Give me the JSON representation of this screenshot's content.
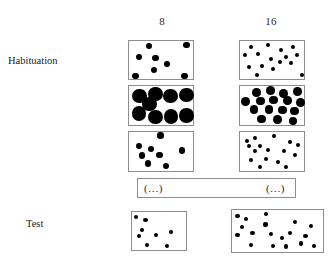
{
  "figure": {
    "columns": [
      {
        "id": "col-8",
        "label": "8"
      },
      {
        "id": "col-16",
        "label": "16"
      }
    ],
    "rows": [
      {
        "id": "row-habituation",
        "label": "Habituation"
      },
      {
        "id": "row-test",
        "label": "Test"
      }
    ],
    "continuation": {
      "left_label": "(…)",
      "right_label": "(…)"
    },
    "colors": {
      "dot": "#000000",
      "box_border": "#8e8e8e",
      "background": "#ffffff",
      "text": "#1a1a1a"
    }
  },
  "chart_data": {
    "type": "scatter",
    "xlabel": "",
    "ylabel": "",
    "grid": false,
    "legend": "none",
    "columns": [
      "8",
      "16"
    ],
    "rows": [
      "Habituation",
      "Test"
    ],
    "panels": [
      {
        "id": "hab-8-a",
        "row": "Habituation",
        "column": "8",
        "numerosity": 8,
        "dot_size": "medium",
        "box": {
          "x": 128,
          "y": 40,
          "w": 66,
          "h": 40
        },
        "dot_radius": 3.2,
        "dots": [
          {
            "x": 0.3,
            "y": 0.13
          },
          {
            "x": 0.87,
            "y": 0.1
          },
          {
            "x": 0.15,
            "y": 0.4
          },
          {
            "x": 0.4,
            "y": 0.43
          },
          {
            "x": 0.58,
            "y": 0.57
          },
          {
            "x": 0.38,
            "y": 0.73
          },
          {
            "x": 0.1,
            "y": 0.87
          },
          {
            "x": 0.84,
            "y": 0.88
          }
        ]
      },
      {
        "id": "hab-16-a",
        "row": "Habituation",
        "column": "16",
        "numerosity": 16,
        "dot_size": "small",
        "box": {
          "x": 239,
          "y": 40,
          "w": 66,
          "h": 40
        },
        "dot_radius": 2.0,
        "dots": [
          {
            "x": 0.16,
            "y": 0.15
          },
          {
            "x": 0.42,
            "y": 0.1
          },
          {
            "x": 0.62,
            "y": 0.22
          },
          {
            "x": 0.8,
            "y": 0.14
          },
          {
            "x": 0.08,
            "y": 0.36
          },
          {
            "x": 0.27,
            "y": 0.33
          },
          {
            "x": 0.47,
            "y": 0.44
          },
          {
            "x": 0.7,
            "y": 0.41
          },
          {
            "x": 0.86,
            "y": 0.36
          },
          {
            "x": 0.6,
            "y": 0.52
          },
          {
            "x": 0.78,
            "y": 0.56
          },
          {
            "x": 0.14,
            "y": 0.64
          },
          {
            "x": 0.33,
            "y": 0.62
          },
          {
            "x": 0.5,
            "y": 0.7
          },
          {
            "x": 0.26,
            "y": 0.86
          },
          {
            "x": 0.94,
            "y": 0.84
          }
        ]
      },
      {
        "id": "hab-8-b",
        "row": "Habituation",
        "column": "8",
        "numerosity": 8,
        "dot_size": "large",
        "box": {
          "x": 128,
          "y": 85,
          "w": 66,
          "h": 41
        },
        "dot_radius": 7.2,
        "dots": [
          {
            "x": 0.16,
            "y": 0.24
          },
          {
            "x": 0.4,
            "y": 0.2
          },
          {
            "x": 0.63,
            "y": 0.25
          },
          {
            "x": 0.87,
            "y": 0.22
          },
          {
            "x": 0.31,
            "y": 0.44
          },
          {
            "x": 0.15,
            "y": 0.67
          },
          {
            "x": 0.4,
            "y": 0.76
          },
          {
            "x": 0.64,
            "y": 0.74
          },
          {
            "x": 0.87,
            "y": 0.72
          }
        ]
      },
      {
        "id": "hab-16-b",
        "row": "Habituation",
        "column": "16",
        "numerosity": 16,
        "dot_size": "medium",
        "box": {
          "x": 239,
          "y": 85,
          "w": 66,
          "h": 41
        },
        "dot_radius": 4.3,
        "dots": [
          {
            "x": 0.25,
            "y": 0.16
          },
          {
            "x": 0.46,
            "y": 0.11
          },
          {
            "x": 0.66,
            "y": 0.18
          },
          {
            "x": 0.87,
            "y": 0.14
          },
          {
            "x": 0.08,
            "y": 0.38
          },
          {
            "x": 0.31,
            "y": 0.37
          },
          {
            "x": 0.51,
            "y": 0.34
          },
          {
            "x": 0.72,
            "y": 0.35
          },
          {
            "x": 0.92,
            "y": 0.4
          },
          {
            "x": 0.21,
            "y": 0.58
          },
          {
            "x": 0.44,
            "y": 0.57
          },
          {
            "x": 0.64,
            "y": 0.59
          },
          {
            "x": 0.83,
            "y": 0.61
          },
          {
            "x": 0.33,
            "y": 0.8
          },
          {
            "x": 0.57,
            "y": 0.82
          },
          {
            "x": 0.8,
            "y": 0.85
          }
        ]
      },
      {
        "id": "hab-8-c",
        "row": "Habituation",
        "column": "8",
        "numerosity": 8,
        "dot_size": "medium",
        "box": {
          "x": 128,
          "y": 131,
          "w": 66,
          "h": 41
        },
        "dot_radius": 3.2,
        "dots": [
          {
            "x": 0.48,
            "y": 0.09
          },
          {
            "x": 0.15,
            "y": 0.34
          },
          {
            "x": 0.33,
            "y": 0.42
          },
          {
            "x": 0.2,
            "y": 0.57
          },
          {
            "x": 0.46,
            "y": 0.56
          },
          {
            "x": 0.8,
            "y": 0.45
          },
          {
            "x": 0.29,
            "y": 0.77
          },
          {
            "x": 0.56,
            "y": 0.83
          }
        ]
      },
      {
        "id": "hab-16-c",
        "row": "Habituation",
        "column": "16",
        "numerosity": 16,
        "dot_size": "small",
        "box": {
          "x": 239,
          "y": 131,
          "w": 66,
          "h": 41
        },
        "dot_radius": 2.0,
        "dots": [
          {
            "x": 0.1,
            "y": 0.21
          },
          {
            "x": 0.23,
            "y": 0.15
          },
          {
            "x": 0.52,
            "y": 0.1
          },
          {
            "x": 0.76,
            "y": 0.25
          },
          {
            "x": 0.14,
            "y": 0.33
          },
          {
            "x": 0.3,
            "y": 0.34
          },
          {
            "x": 0.88,
            "y": 0.32
          },
          {
            "x": 0.22,
            "y": 0.47
          },
          {
            "x": 0.43,
            "y": 0.43
          },
          {
            "x": 0.67,
            "y": 0.47
          },
          {
            "x": 0.84,
            "y": 0.55
          },
          {
            "x": 0.17,
            "y": 0.68
          },
          {
            "x": 0.4,
            "y": 0.65
          },
          {
            "x": 0.58,
            "y": 0.72
          },
          {
            "x": 0.3,
            "y": 0.85
          },
          {
            "x": 0.7,
            "y": 0.86
          }
        ]
      },
      {
        "id": "test-8",
        "row": "Test",
        "column": "8",
        "numerosity": 8,
        "dot_size": "small",
        "box": {
          "x": 131,
          "y": 211,
          "w": 56,
          "h": 40
        },
        "dot_radius": 2.1,
        "dots": [
          {
            "x": 0.07,
            "y": 0.12
          },
          {
            "x": 0.24,
            "y": 0.21
          },
          {
            "x": 0.18,
            "y": 0.45
          },
          {
            "x": 0.13,
            "y": 0.6
          },
          {
            "x": 0.43,
            "y": 0.58
          },
          {
            "x": 0.7,
            "y": 0.5
          },
          {
            "x": 0.27,
            "y": 0.82
          },
          {
            "x": 0.62,
            "y": 0.84
          }
        ]
      },
      {
        "id": "test-16",
        "row": "Test",
        "column": "16",
        "numerosity": 16,
        "dot_size": "small",
        "box": {
          "x": 231,
          "y": 209,
          "w": 93,
          "h": 44
        },
        "dot_radius": 2.1,
        "dots": [
          {
            "x": 0.06,
            "y": 0.13
          },
          {
            "x": 0.15,
            "y": 0.2
          },
          {
            "x": 0.37,
            "y": 0.1
          },
          {
            "x": 0.11,
            "y": 0.38
          },
          {
            "x": 0.36,
            "y": 0.33
          },
          {
            "x": 0.68,
            "y": 0.27
          },
          {
            "x": 0.85,
            "y": 0.36
          },
          {
            "x": 0.06,
            "y": 0.56
          },
          {
            "x": 0.22,
            "y": 0.52
          },
          {
            "x": 0.42,
            "y": 0.55
          },
          {
            "x": 0.54,
            "y": 0.63
          },
          {
            "x": 0.62,
            "y": 0.52
          },
          {
            "x": 0.79,
            "y": 0.6
          },
          {
            "x": 0.2,
            "y": 0.8
          },
          {
            "x": 0.44,
            "y": 0.81
          },
          {
            "x": 0.58,
            "y": 0.83
          },
          {
            "x": 0.74,
            "y": 0.76
          },
          {
            "x": 0.88,
            "y": 0.82
          }
        ]
      }
    ]
  }
}
